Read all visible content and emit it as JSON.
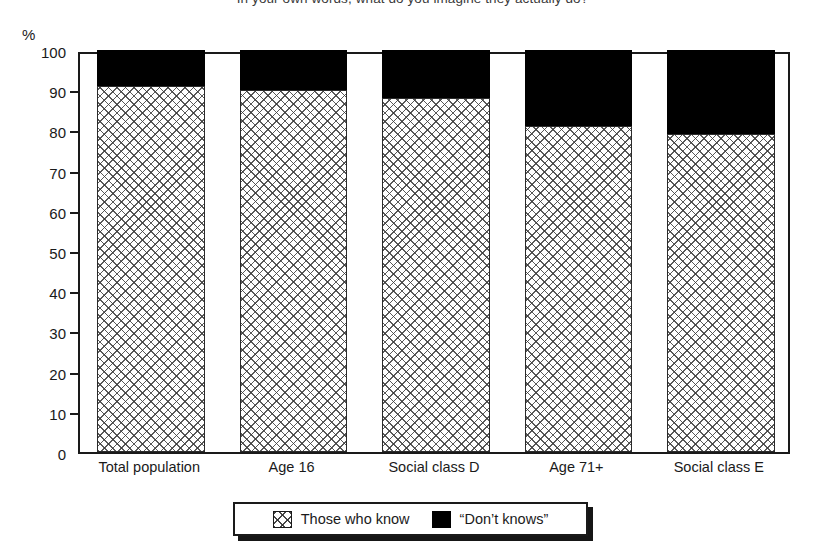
{
  "chart_data": {
    "type": "bar",
    "title": "In your own words, what do you imagine they actually do?",
    "subtype": "stacked-bar-100-percent",
    "xlabel": "",
    "ylabel": "%",
    "ylim": [
      0,
      100
    ],
    "y_ticks": [
      0,
      10,
      20,
      30,
      40,
      50,
      60,
      70,
      80,
      90,
      100
    ],
    "grid": false,
    "legend_position": "bottom-center",
    "categories": [
      "Total population",
      "Age 16",
      "Social class D",
      "Age 71+",
      "Social class E"
    ],
    "series": [
      {
        "name": "Those who know",
        "fill": "crosshatch",
        "color": "#ffffff",
        "values": [
          91,
          90,
          88,
          81,
          79
        ]
      },
      {
        "name": "“Don’t knows”",
        "fill": "solid",
        "color": "#000000",
        "values": [
          9,
          10,
          12,
          19,
          21
        ]
      }
    ]
  },
  "axis": {
    "y_unit_label": "%",
    "y_tick_labels": [
      "100",
      "90",
      "80",
      "70",
      "60",
      "50",
      "40",
      "30",
      "20",
      "10",
      "0"
    ]
  },
  "legend": {
    "items": [
      {
        "label": "Those who know",
        "swatch": "crosshatch-swatch"
      },
      {
        "label": "“Don’t knows”",
        "swatch": "solid-black-swatch"
      }
    ]
  }
}
